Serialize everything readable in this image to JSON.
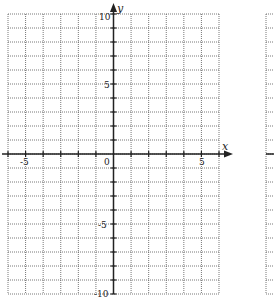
{
  "chart_data": {
    "type": "scatter",
    "title": "",
    "xlabel": "x",
    "ylabel": "y",
    "xlim": [
      -6,
      6
    ],
    "ylim": [
      -10,
      10
    ],
    "grid": true,
    "grid_style": "dotted",
    "x_grid_step": 1,
    "y_grid_step": 1,
    "x_tick_labels": [
      "-5",
      "0",
      "5"
    ],
    "y_tick_labels": [
      "10",
      "5",
      "-5",
      "-10"
    ],
    "series": []
  },
  "labels": {
    "x_axis": "x",
    "y_axis": "y",
    "origin": "0",
    "x_neg5": "-5",
    "x_pos5": "5",
    "y_pos10": "10",
    "y_pos5": "5",
    "y_neg5": "-5",
    "y_neg10": "-10"
  },
  "colors": {
    "grid": "#555555",
    "axis": "#222222"
  }
}
